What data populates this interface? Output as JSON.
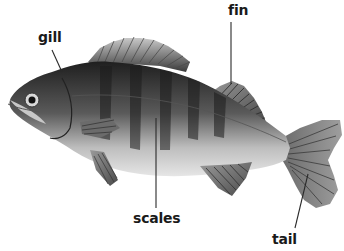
{
  "diagram": {
    "labels": {
      "gill": "gill",
      "fin": "fin",
      "scales": "scales",
      "tail": "tail"
    }
  },
  "colors": {
    "background": "#ffffff",
    "label_text": "#1a1a1a",
    "leader_line": "#2a2a2a",
    "fish_dark": "#2b2b2b",
    "fish_mid": "#6e6e6e",
    "fish_light": "#d9d9d9",
    "fin_gray": "#8a8a8a"
  }
}
